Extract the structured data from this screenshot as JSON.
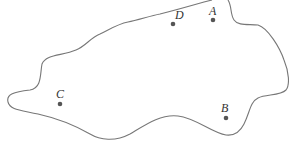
{
  "diagram": {
    "type": "region-with-points",
    "outline_color": "#777777",
    "point_color": "#555555",
    "label_color": "#333333",
    "points": [
      {
        "id": "A",
        "label": "A",
        "x": 213,
        "y": 20,
        "label_x": 209,
        "label_y": 15
      },
      {
        "id": "B",
        "label": "B",
        "x": 226,
        "y": 118,
        "label_x": 221,
        "label_y": 112
      },
      {
        "id": "C",
        "label": "C",
        "x": 60,
        "y": 104,
        "label_x": 56,
        "label_y": 98
      },
      {
        "id": "D",
        "label": "D",
        "x": 173,
        "y": 24,
        "label_x": 175,
        "label_y": 19
      }
    ]
  }
}
